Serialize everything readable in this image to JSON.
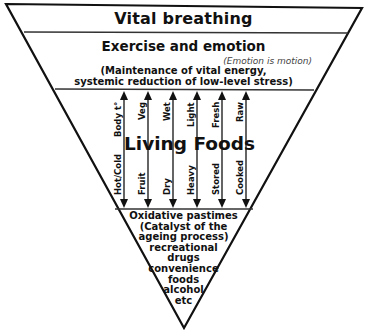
{
  "diagram": {
    "tiers": {
      "top": {
        "label": "Vital breathing"
      },
      "second": {
        "label": "Exercise and emotion",
        "note": "(Emotion is motion)",
        "description_lines": [
          "(Maintenance of vital energy,",
          "systemic reduction of low-level stress)"
        ]
      },
      "middle": {
        "label": "Living Foods",
        "spectra": [
          {
            "top": "Body t°",
            "bottom": "Hot/Cold"
          },
          {
            "top": "Veg",
            "bottom": "Fruit"
          },
          {
            "top": "Wet",
            "bottom": "Dry"
          },
          {
            "top": "Light",
            "bottom": "Heavy"
          },
          {
            "top": "Fresh",
            "bottom": "Stored"
          },
          {
            "top": "Raw",
            "bottom": "Cooked"
          }
        ]
      },
      "bottom": {
        "lines": [
          "Oxidative pastimes",
          "(Catalyst of the",
          "ageing process)",
          "recreational",
          "drugs",
          "convenience",
          "foods",
          "alcohol",
          "etc"
        ]
      }
    },
    "colors": {
      "line": "#111111",
      "background": "#ffffff",
      "note": "#444444"
    }
  }
}
